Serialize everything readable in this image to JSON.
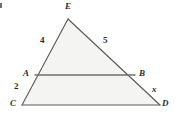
{
  "figure": {
    "width": 180,
    "height": 122,
    "colors": {
      "background": "#ffffff",
      "fill": "#f4f4f3",
      "stroke": "#585858",
      "midline_stroke": "#6f6f6f",
      "label": "#2b2b2b"
    },
    "points": {
      "E": {
        "x": 68,
        "y": 19
      },
      "A": {
        "x": 35,
        "y": 75
      },
      "B": {
        "x": 135,
        "y": 75
      },
      "C": {
        "x": 22,
        "y": 105
      },
      "D": {
        "x": 160,
        "y": 105
      }
    },
    "segments": [
      {
        "name": "EC",
        "from": "E",
        "to": "C"
      },
      {
        "name": "ED",
        "from": "E",
        "to": "D"
      },
      {
        "name": "CD",
        "from": "C",
        "to": "D"
      },
      {
        "name": "AB",
        "from": "A",
        "to": "B"
      }
    ],
    "labels": [
      {
        "id": "vertex-e",
        "text": "E",
        "x": 65,
        "y": 2,
        "kind": "vertex"
      },
      {
        "id": "side-ea",
        "text": "4",
        "x": 40,
        "y": 36,
        "kind": "measure"
      },
      {
        "id": "side-eb",
        "text": "5",
        "x": 103,
        "y": 36,
        "kind": "measure"
      },
      {
        "id": "vertex-a",
        "text": "A",
        "x": 23,
        "y": 69,
        "kind": "vertex"
      },
      {
        "id": "vertex-b",
        "text": "B",
        "x": 139,
        "y": 69,
        "kind": "vertex"
      },
      {
        "id": "side-ac",
        "text": "2",
        "x": 14,
        "y": 82,
        "kind": "measure"
      },
      {
        "id": "side-bd",
        "text": "x",
        "x": 152,
        "y": 85,
        "kind": "measure"
      },
      {
        "id": "vertex-c",
        "text": "C",
        "x": 10,
        "y": 99,
        "kind": "vertex"
      },
      {
        "id": "vertex-d",
        "text": "D",
        "x": 162,
        "y": 99,
        "kind": "vertex"
      }
    ]
  },
  "chart_data": {
    "type": "diagram",
    "shape": "triangle",
    "vertices": [
      "C",
      "E",
      "D"
    ],
    "midsegment": [
      "A",
      "B"
    ],
    "side_measures": {
      "EA": "4",
      "EB": "5",
      "AC": "2",
      "BD": "x"
    },
    "relations": [
      "AB parallel to CD"
    ],
    "unknown": "x"
  }
}
